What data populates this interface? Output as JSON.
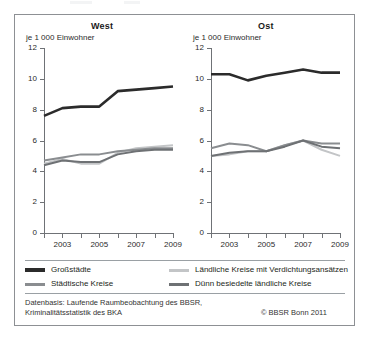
{
  "figure": {
    "axis_unit_label": "je 1 000 Einwohner",
    "source_note": "Datenbasis: Laufende Raumbeobachtung des BBSR,\nKriminalitätsstatistik des BKA",
    "copyright": "© BBSR Bonn 2011"
  },
  "legend": {
    "items": [
      {
        "label": "Großstädte",
        "color": "#2b2b2b"
      },
      {
        "label": "Städtische Kreise",
        "color": "#8a8d90"
      },
      {
        "label": "Ländliche Kreise mit Verdichtungsansätzen",
        "color": "#c3c5c7"
      },
      {
        "label": "Dünn besiedelte ländliche Kreise",
        "color": "#6e7174"
      }
    ]
  },
  "chart_data": [
    {
      "type": "line",
      "title": "West",
      "xlabel": "",
      "ylabel": "je 1 000 Einwohner",
      "x": [
        2002,
        2003,
        2004,
        2005,
        2006,
        2007,
        2008,
        2009
      ],
      "xtick_labels": [
        "2003",
        "2005",
        "2007",
        "2009"
      ],
      "xticks": [
        2003,
        2005,
        2007,
        2009
      ],
      "ytick_labels": [
        "0",
        "2",
        "4",
        "6",
        "8",
        "10",
        "12"
      ],
      "yticks": [
        0,
        2,
        4,
        6,
        8,
        10,
        12
      ],
      "xlim": [
        2002,
        2009
      ],
      "ylim": [
        0,
        12
      ],
      "grid": false,
      "legend_position": "below",
      "series": [
        {
          "name": "Großstädte",
          "color": "#2b2b2b",
          "values": [
            7.6,
            8.1,
            8.2,
            8.2,
            9.2,
            9.3,
            9.4,
            9.5
          ]
        },
        {
          "name": "Städtische Kreise",
          "color": "#8a8d90",
          "values": [
            4.7,
            4.9,
            5.1,
            5.1,
            5.3,
            5.4,
            5.5,
            5.5
          ]
        },
        {
          "name": "Ländliche Kreise mit Verdichtungsansätzen",
          "color": "#c3c5c7",
          "values": [
            4.5,
            4.8,
            4.5,
            4.5,
            5.2,
            5.5,
            5.6,
            5.7
          ]
        },
        {
          "name": "Dünn besiedelte ländliche Kreise",
          "color": "#6e7174",
          "values": [
            4.4,
            4.7,
            4.6,
            4.6,
            5.1,
            5.3,
            5.4,
            5.4
          ]
        }
      ]
    },
    {
      "type": "line",
      "title": "Ost",
      "xlabel": "",
      "ylabel": "je 1 000 Einwohner",
      "x": [
        2002,
        2003,
        2004,
        2005,
        2006,
        2007,
        2008,
        2009
      ],
      "xtick_labels": [
        "2003",
        "2005",
        "2007",
        "2009"
      ],
      "xticks": [
        2003,
        2005,
        2007,
        2009
      ],
      "ytick_labels": [
        "0",
        "2",
        "4",
        "6",
        "8",
        "10",
        "12"
      ],
      "yticks": [
        0,
        2,
        4,
        6,
        8,
        10,
        12
      ],
      "xlim": [
        2002,
        2009
      ],
      "ylim": [
        0,
        12
      ],
      "grid": false,
      "legend_position": "below",
      "series": [
        {
          "name": "Großstädte",
          "color": "#2b2b2b",
          "values": [
            10.3,
            10.3,
            9.9,
            10.2,
            10.4,
            10.6,
            10.4,
            10.4
          ]
        },
        {
          "name": "Städtische Kreise",
          "color": "#8a8d90",
          "values": [
            5.5,
            5.8,
            5.7,
            5.3,
            5.7,
            6.0,
            5.8,
            5.8
          ]
        },
        {
          "name": "Ländliche Kreise mit Verdichtungsansätzen",
          "color": "#c3c5c7",
          "values": [
            5.0,
            5.1,
            5.3,
            5.3,
            5.7,
            6.0,
            5.4,
            5.0
          ]
        },
        {
          "name": "Dünn besiedelte ländliche Kreise",
          "color": "#6e7174",
          "values": [
            5.0,
            5.2,
            5.3,
            5.3,
            5.6,
            6.0,
            5.6,
            5.5
          ]
        }
      ]
    }
  ]
}
